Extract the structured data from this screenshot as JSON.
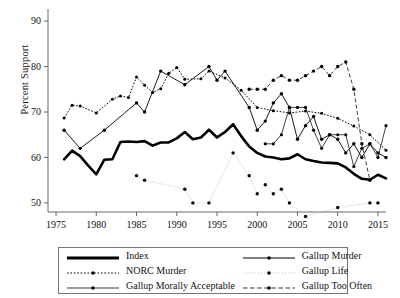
{
  "chart_data": {
    "type": "line",
    "title": "",
    "xlabel": "",
    "ylabel": "Percent Support",
    "xlim": [
      1974,
      2016
    ],
    "ylim": [
      48,
      92
    ],
    "xticks": [
      1975,
      1980,
      1985,
      1990,
      1995,
      2000,
      2005,
      2010,
      2015
    ],
    "yticks": [
      50,
      60,
      70,
      80,
      90
    ],
    "grid": false,
    "legend_position": "below-plot",
    "series": [
      {
        "name": "Index",
        "style": "thick-solid",
        "points": [
          [
            1976,
            59.6
          ],
          [
            1977,
            61.5
          ],
          [
            1978,
            60.3
          ],
          [
            1979,
            58.2
          ],
          [
            1980,
            56.3
          ],
          [
            1981,
            59.5
          ],
          [
            1982,
            59.6
          ],
          [
            1983,
            63.4
          ],
          [
            1984,
            63.5
          ],
          [
            1985,
            63.4
          ],
          [
            1986,
            63.6
          ],
          [
            1987,
            62.6
          ],
          [
            1988,
            63.3
          ],
          [
            1989,
            63.3
          ],
          [
            1990,
            64.2
          ],
          [
            1991,
            65.6
          ],
          [
            1992,
            64.0
          ],
          [
            1993,
            64.4
          ],
          [
            1994,
            66.1
          ],
          [
            1995,
            64.4
          ],
          [
            1996,
            65.6
          ],
          [
            1997,
            67.3
          ],
          [
            1998,
            64.7
          ],
          [
            1999,
            62.4
          ],
          [
            2000,
            61.0
          ],
          [
            2001,
            60.2
          ],
          [
            2002,
            60.0
          ],
          [
            2003,
            59.6
          ],
          [
            2004,
            59.8
          ],
          [
            2005,
            60.7
          ],
          [
            2006,
            59.6
          ],
          [
            2007,
            59.2
          ],
          [
            2008,
            58.9
          ],
          [
            2009,
            58.8
          ],
          [
            2010,
            58.7
          ],
          [
            2011,
            57.8
          ],
          [
            2012,
            56.4
          ],
          [
            2013,
            55.3
          ],
          [
            2014,
            55.1
          ],
          [
            2015,
            56.2
          ],
          [
            2016,
            55.4
          ]
        ]
      },
      {
        "name": "NORC Murder",
        "style": "fine-dotted",
        "points": [
          [
            1976,
            68.7
          ],
          [
            1977,
            71.5
          ],
          [
            1978,
            71.3
          ],
          [
            1980,
            69.8
          ],
          [
            1982,
            72.8
          ],
          [
            1983,
            73.5
          ],
          [
            1984,
            73.2
          ],
          [
            1985,
            77.7
          ],
          [
            1986,
            75.9
          ],
          [
            1987,
            74.3
          ],
          [
            1988,
            75.1
          ],
          [
            1989,
            78.5
          ],
          [
            1990,
            79.8
          ],
          [
            1991,
            77.2
          ],
          [
            1993,
            77.3
          ],
          [
            1994,
            79.0
          ],
          [
            1996,
            77.5
          ],
          [
            1998,
            74.8
          ],
          [
            2000,
            71.0
          ],
          [
            2002,
            70.3
          ],
          [
            2004,
            69.8
          ],
          [
            2006,
            70.2
          ],
          [
            2008,
            69.7
          ],
          [
            2010,
            68.6
          ],
          [
            2012,
            66.9
          ],
          [
            2014,
            65.0
          ],
          [
            2016,
            61.6
          ]
        ]
      },
      {
        "name": "Gallup Morally Acceptable",
        "style": "thin-solid-dots",
        "points": [
          [
            2001,
            63.0
          ],
          [
            2002,
            63.0
          ],
          [
            2003,
            65.0
          ],
          [
            2004,
            71.0
          ],
          [
            2005,
            71.0
          ],
          [
            2006,
            71.0
          ],
          [
            2007,
            66.0
          ],
          [
            2008,
            62.0
          ],
          [
            2009,
            65.0
          ],
          [
            2010,
            65.0
          ],
          [
            2011,
            65.0
          ],
          [
            2012,
            58.0
          ],
          [
            2013,
            62.0
          ],
          [
            2014,
            63.0
          ],
          [
            2015,
            60.0
          ],
          [
            2016,
            67.0
          ]
        ]
      },
      {
        "name": "Gallup Murder",
        "style": "solid-dots",
        "points": [
          [
            1976,
            66.0
          ],
          [
            1978,
            62.0
          ],
          [
            1981,
            66.0
          ],
          [
            1985,
            72.0
          ],
          [
            1986,
            70.0
          ],
          [
            1988,
            79.0
          ],
          [
            1991,
            76.0
          ],
          [
            1994,
            80.0
          ],
          [
            1995,
            77.0
          ],
          [
            1996,
            79.0
          ],
          [
            1999,
            71.0
          ],
          [
            2000,
            66.0
          ],
          [
            2001,
            68.0
          ],
          [
            2002,
            72.0
          ],
          [
            2003,
            74.0
          ],
          [
            2004,
            71.0
          ],
          [
            2005,
            64.0
          ],
          [
            2006,
            67.0
          ],
          [
            2007,
            69.0
          ],
          [
            2008,
            64.0
          ],
          [
            2009,
            65.0
          ],
          [
            2010,
            64.0
          ],
          [
            2011,
            61.0
          ],
          [
            2012,
            63.0
          ],
          [
            2013,
            60.0
          ],
          [
            2014,
            63.0
          ],
          [
            2015,
            61.0
          ],
          [
            2016,
            60.0
          ]
        ]
      },
      {
        "name": "Gallup Life",
        "style": "light-dotted",
        "points": [
          [
            1985,
            56.0
          ],
          [
            1986,
            55.0
          ],
          [
            1991,
            53.0
          ],
          [
            1992,
            50.0
          ],
          [
            1994,
            50.0
          ],
          [
            1997,
            61.0
          ],
          [
            1999,
            56.0
          ],
          [
            2000,
            52.0
          ],
          [
            2001,
            54.0
          ],
          [
            2002,
            52.0
          ],
          [
            2003,
            53.0
          ],
          [
            2004,
            50.0
          ],
          [
            2006,
            47.0
          ],
          [
            2010,
            49.0
          ],
          [
            2014,
            50.0
          ],
          [
            2015,
            50.0
          ]
        ]
      },
      {
        "name": "Gallup Too Often",
        "style": "dashed-dots",
        "points": [
          [
            1999,
            75.0
          ],
          [
            2000,
            75.0
          ],
          [
            2001,
            75.0
          ],
          [
            2002,
            77.0
          ],
          [
            2003,
            78.0
          ],
          [
            2004,
            77.0
          ],
          [
            2005,
            77.0
          ],
          [
            2006,
            78.0
          ],
          [
            2007,
            79.0
          ],
          [
            2008,
            80.0
          ],
          [
            2009,
            78.0
          ],
          [
            2010,
            80.0
          ],
          [
            2011,
            81.0
          ],
          [
            2012,
            75.0
          ],
          [
            2013,
            63.0
          ],
          [
            2014,
            55.0
          ]
        ]
      }
    ]
  },
  "axes": {
    "y_title": "Percent Support",
    "y_tick_labels": [
      "50",
      "60",
      "70",
      "80",
      "90"
    ],
    "x_tick_labels": [
      "1975",
      "1980",
      "1985",
      "1990",
      "1995",
      "2000",
      "2005",
      "2010",
      "2015"
    ]
  },
  "legend": {
    "entries": [
      {
        "label": "Index",
        "symbol": "thick-solid-line",
        "column": 0,
        "row": 0
      },
      {
        "label": "NORC Murder",
        "symbol": "fine-dotted-line-marker",
        "column": 0,
        "row": 1
      },
      {
        "label": "Gallup Morally Acceptable",
        "symbol": "thin-solid-line-marker",
        "column": 0,
        "row": 2
      },
      {
        "label": "Gallup Murder",
        "symbol": "solid-line-marker",
        "column": 1,
        "row": 0
      },
      {
        "label": "Gallup Life",
        "symbol": "light-dotted-line-marker",
        "column": 1,
        "row": 1
      },
      {
        "label": "Gallup Too Often",
        "symbol": "dashed-line-marker",
        "column": 1,
        "row": 2
      }
    ]
  },
  "colors": {
    "ink": "#000000",
    "axis": "#555555",
    "light_series": "#bbbbbb",
    "background": "#ffffff"
  }
}
